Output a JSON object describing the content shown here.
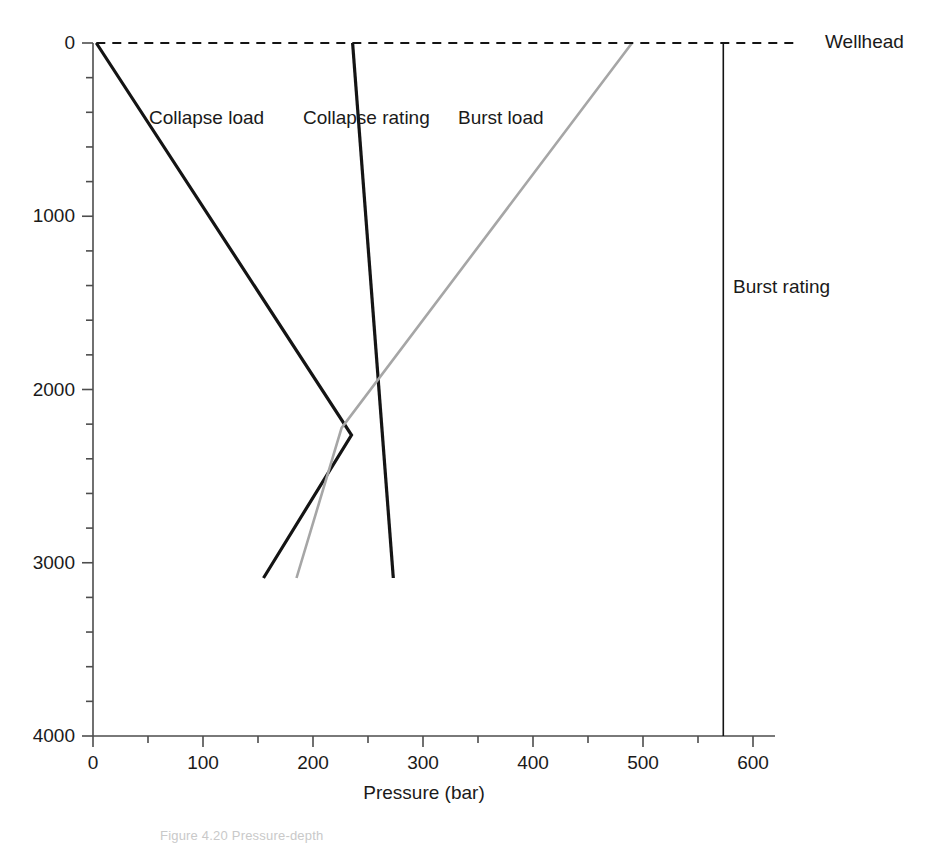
{
  "figure": {
    "caption_fragment": "Figure 4.20  Pressure-depth",
    "background_color": "#ffffff"
  },
  "chart_data": {
    "type": "line",
    "title": "",
    "xlabel": "Pressure (bar)",
    "ylabel": "",
    "xlim": [
      0,
      640
    ],
    "ylim": [
      4000,
      0
    ],
    "y_axis_inverted": true,
    "grid": false,
    "legend": "inline-annotations",
    "xticks": [
      0,
      100,
      200,
      300,
      400,
      500,
      600
    ],
    "xtick_labels": [
      "0",
      "100",
      "200",
      "300",
      "400",
      "500",
      "600"
    ],
    "x_minor_tick_step": 50,
    "yticks": [
      0,
      1000,
      2000,
      3000,
      4000
    ],
    "ytick_labels": [
      "0",
      "1000",
      "2000",
      "3000",
      "4000"
    ],
    "y_minor_tick_step": 200,
    "series": [
      {
        "name": "Collapse load",
        "label": "Collapse load",
        "color": "#141414",
        "style": "solid",
        "width": 3.2,
        "label_x": 149,
        "label_y": 118,
        "points": [
          {
            "pressure": 3,
            "depth": 0
          },
          {
            "pressure": 235,
            "depth": 2263
          },
          {
            "pressure": 155,
            "depth": 3088
          }
        ]
      },
      {
        "name": "Collapse rating",
        "label": "Collapse rating",
        "color": "#141414",
        "style": "solid",
        "width": 3.2,
        "label_x": 303,
        "label_y": 118,
        "points": [
          {
            "pressure": 236,
            "depth": 0
          },
          {
            "pressure": 273,
            "depth": 3088
          }
        ]
      },
      {
        "name": "Burst load",
        "label": "Burst load",
        "color": "#a6a6a6",
        "style": "solid",
        "width": 2.6,
        "label_x": 458,
        "label_y": 118,
        "points": [
          {
            "pressure": 490,
            "depth": 0
          },
          {
            "pressure": 226,
            "depth": 2222
          },
          {
            "pressure": 185,
            "depth": 3088
          }
        ]
      },
      {
        "name": "Burst rating",
        "label": "Burst rating",
        "color": "#141414",
        "style": "solid",
        "width": 1.6,
        "label_x": 733,
        "label_y": 287,
        "points": [
          {
            "pressure": 573,
            "depth": 0
          },
          {
            "pressure": 573,
            "depth": 4000
          }
        ]
      },
      {
        "name": "Wellhead",
        "label": "Wellhead",
        "color": "#141414",
        "style": "dashed",
        "width": 2.0,
        "label_x": 825,
        "label_y": 42,
        "points": [
          {
            "pressure": 3,
            "depth": 0
          },
          {
            "pressure": 640,
            "depth": 0
          }
        ]
      }
    ]
  }
}
